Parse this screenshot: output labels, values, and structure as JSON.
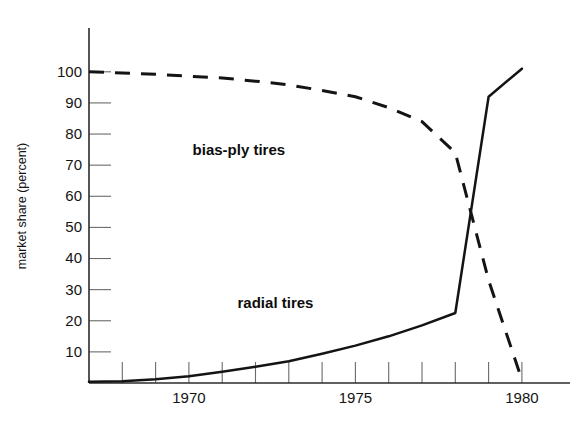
{
  "chart_data": {
    "type": "line",
    "title": "",
    "subtitle": "",
    "xlabel": "",
    "ylabel": "market share (percent)",
    "xlim": [
      1967.0,
      1980.9
    ],
    "ylim": [
      0,
      103
    ],
    "grid": false,
    "legend_position": "inline-annotation",
    "y_ticks": [
      10,
      20,
      30,
      40,
      50,
      60,
      70,
      80,
      90,
      100
    ],
    "y_tick_labels": [
      "10",
      "20",
      "30",
      "40",
      "50",
      "60",
      "70",
      "80",
      "90",
      "100"
    ],
    "x_ticks": [
      1968,
      1969,
      1970,
      1971,
      1972,
      1973,
      1974,
      1975,
      1976,
      1977,
      1978,
      1979,
      1980
    ],
    "x_tick_labels_shown": [
      "1970",
      "1975",
      "1980"
    ],
    "x_labeled_ticks": [
      1970,
      1975,
      1980
    ],
    "series": [
      {
        "name": "bias-ply tires",
        "style": "dashed",
        "annotation": "bias-ply tires",
        "annotation_x": 1971.5,
        "annotation_y": 74.5,
        "x": [
          1967.0,
          1968,
          1969,
          1970,
          1971,
          1972,
          1973,
          1974,
          1975,
          1976,
          1977,
          1978,
          1979,
          1980
        ],
        "values": [
          100,
          99.6,
          99.2,
          98.6,
          98,
          97,
          95.8,
          94,
          92,
          88.5,
          84,
          74,
          33,
          1
        ]
      },
      {
        "name": "radial tires",
        "style": "solid",
        "annotation": "radial tires",
        "annotation_x": 1972.6,
        "annotation_y": 25.5,
        "x": [
          1967.0,
          1968,
          1969,
          1970,
          1971,
          1972,
          1973,
          1974,
          1975,
          1976,
          1977,
          1978,
          1979,
          1980
        ],
        "values": [
          0.4,
          0.6,
          1.2,
          2.2,
          3.6,
          5.2,
          7.0,
          9.4,
          12.0,
          15.0,
          18.5,
          22.5,
          92,
          101
        ]
      }
    ],
    "annotations": [
      {
        "text": "bias-ply tires",
        "x": 1971.5,
        "y": 74.5
      },
      {
        "text": "radial tires",
        "x": 1972.6,
        "y": 25.5
      }
    ],
    "colors": {
      "line": "#141414",
      "axis": "#2b2b2b",
      "tick": "#6a6a6a",
      "background": "#ffffff"
    }
  }
}
